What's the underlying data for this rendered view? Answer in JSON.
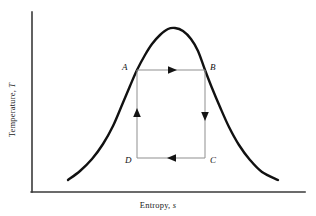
{
  "figure": {
    "kind": "temperature-entropy-diagram",
    "background_color": "#ffffff",
    "width": 316,
    "height": 216
  },
  "axes": {
    "x_label_prefix": "Entropy, ",
    "x_label_symbol": "s",
    "y_label_prefix": "Temperature, ",
    "y_label_symbol": "T",
    "axis_color": "#3a3a3a",
    "x_axis": {
      "x1": 32,
      "y1": 192,
      "x2": 305,
      "y2": 192
    },
    "y_axis": {
      "x1": 32,
      "y1": 12,
      "x2": 32,
      "y2": 192
    }
  },
  "chart_data": {
    "type": "line",
    "title": "",
    "xlabel": "Entropy, s",
    "ylabel": "Temperature, T",
    "grid": false,
    "legend": "none",
    "xlim": [
      32,
      305
    ],
    "ylim": [
      192,
      12
    ],
    "series": [
      {
        "name": "saturation-dome",
        "color": "#111111",
        "linewidth": 2.4,
        "points": [
          [
            68,
            180
          ],
          [
            80,
            171
          ],
          [
            92,
            159
          ],
          [
            103,
            144
          ],
          [
            113,
            126
          ],
          [
            122,
            105
          ],
          [
            130,
            86
          ],
          [
            137,
            70
          ],
          [
            145,
            55
          ],
          [
            152,
            44
          ],
          [
            160,
            35
          ],
          [
            168,
            29
          ],
          [
            175,
            28
          ],
          [
            183,
            31
          ],
          [
            191,
            39
          ],
          [
            198,
            51
          ],
          [
            205,
            70
          ],
          [
            212,
            88
          ],
          [
            220,
            107
          ],
          [
            229,
            127
          ],
          [
            239,
            145
          ],
          [
            250,
            160
          ],
          [
            262,
            172
          ],
          [
            278,
            180
          ]
        ]
      },
      {
        "name": "carnot-cycle-rectangle",
        "color": "#8f8f8f",
        "linewidth": 1,
        "closed": true,
        "points": [
          [
            137,
            70
          ],
          [
            205,
            70
          ],
          [
            205,
            158
          ],
          [
            137,
            158
          ]
        ]
      }
    ],
    "annotations": [
      {
        "name": "point-A",
        "label": "A",
        "x": 137,
        "y": 70,
        "label_x": 122,
        "label_y": 62
      },
      {
        "name": "point-B",
        "label": "B",
        "x": 205,
        "y": 70,
        "label_x": 210,
        "label_y": 62
      },
      {
        "name": "point-C",
        "label": "C",
        "x": 205,
        "y": 158,
        "label_x": 210,
        "label_y": 155
      },
      {
        "name": "point-D",
        "label": "D",
        "x": 137,
        "y": 158,
        "label_x": 125,
        "label_y": 155
      }
    ],
    "process_arrows": [
      {
        "name": "A-to-B",
        "from": "A",
        "to": "B",
        "direction": "right",
        "at_x": 172,
        "at_y": 70
      },
      {
        "name": "B-to-C",
        "from": "B",
        "to": "C",
        "direction": "down",
        "at_x": 205,
        "at_y": 116
      },
      {
        "name": "C-to-D",
        "from": "C",
        "to": "D",
        "direction": "left",
        "at_x": 172,
        "at_y": 158
      },
      {
        "name": "D-to-A",
        "from": "D",
        "to": "A",
        "direction": "up",
        "at_x": 137,
        "at_y": 114
      }
    ]
  }
}
